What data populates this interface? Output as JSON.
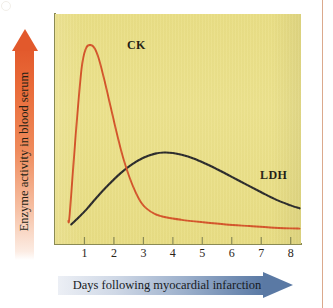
{
  "figure": {
    "background_color": "#ffffff",
    "plot_background_color": "#ece28d",
    "axis_color": "#8a8a54",
    "page_rule_color": "#dba98c"
  },
  "axis_titles": {
    "x": "Days following myocardial infarction",
    "y": "Enzyme activity in blood serum",
    "x_arrow_color": "#5a79a4",
    "y_arrow_color": "#e2592c"
  },
  "chart_data": {
    "type": "line",
    "title": "",
    "subtitle": "",
    "xlabel": "Days following myocardial infarction",
    "ylabel": "Enzyme activity in blood serum",
    "xlim": [
      0,
      8.35
    ],
    "ylim": [
      0,
      1.0
    ],
    "xticks": [
      "1",
      "2",
      "3",
      "4",
      "5",
      "6",
      "7",
      "8"
    ],
    "xtick_values": [
      1,
      2,
      3,
      4,
      5,
      6,
      7,
      8
    ],
    "yticks": [],
    "grid": false,
    "legend": "inline-annotations",
    "annotations": [
      {
        "text": "CK",
        "x": 1.2,
        "y": 0.95
      },
      {
        "text": "LDH",
        "x": 5.6,
        "y": 0.4
      }
    ],
    "series": [
      {
        "name": "CK",
        "color": "#d4552a",
        "x": [
          0.45,
          0.5,
          0.7,
          0.9,
          1.05,
          1.2,
          1.35,
          1.5,
          1.7,
          1.9,
          2.1,
          2.3,
          2.5,
          2.7,
          2.9,
          3.1,
          3.4,
          3.8,
          4.3,
          5.0,
          5.8,
          6.6,
          7.3,
          8.0,
          8.3
        ],
        "y": [
          0.1,
          0.13,
          0.47,
          0.76,
          0.85,
          0.865,
          0.85,
          0.8,
          0.7,
          0.59,
          0.48,
          0.38,
          0.3,
          0.235,
          0.185,
          0.155,
          0.13,
          0.115,
          0.105,
          0.095,
          0.085,
          0.078,
          0.072,
          0.068,
          0.067
        ]
      },
      {
        "name": "LDH",
        "color": "#2b2b2b",
        "x": [
          0.55,
          0.8,
          1.1,
          1.4,
          1.8,
          2.2,
          2.6,
          3.0,
          3.4,
          3.7,
          4.0,
          4.3,
          4.7,
          5.1,
          5.5,
          6.0,
          6.5,
          7.0,
          7.5,
          8.0,
          8.3
        ],
        "y": [
          0.085,
          0.115,
          0.155,
          0.2,
          0.255,
          0.305,
          0.345,
          0.375,
          0.393,
          0.398,
          0.396,
          0.388,
          0.372,
          0.35,
          0.325,
          0.292,
          0.258,
          0.225,
          0.193,
          0.168,
          0.155
        ]
      }
    ]
  }
}
